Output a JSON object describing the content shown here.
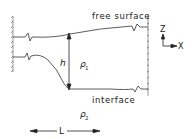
{
  "diagram": {
    "labels": {
      "free_surface": "free surface",
      "interface": "interface",
      "height": "h",
      "rho1": "ρ",
      "rho1_sub": "1",
      "rho2": "ρ",
      "rho2_sub": "2",
      "length": "L",
      "axis_z": "Z",
      "axis_x": "X"
    },
    "colors": {
      "line": "#333333",
      "background": "#ffffff"
    }
  }
}
